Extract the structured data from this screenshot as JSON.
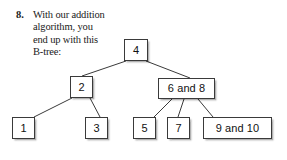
{
  "question": {
    "number": "8.",
    "text": "With our addition\nalgorithm, you\nend up with this\nB-tree:"
  },
  "diagram": {
    "kind": "b-tree",
    "line_color": "#3a3a3a",
    "box_border_color": "#3a3a3a",
    "box_fill_color": "#ffffff",
    "text_color": "#111111",
    "nodes": [
      {
        "id": "root",
        "label": "4",
        "x": 124,
        "y": 39,
        "w": 24,
        "h": 22,
        "level": 0
      },
      {
        "id": "left",
        "label": "2",
        "x": 70,
        "y": 76,
        "w": 23,
        "h": 22,
        "level": 1
      },
      {
        "id": "right",
        "label": "6 and 8",
        "x": 158,
        "y": 78,
        "w": 57,
        "h": 21,
        "level": 1
      },
      {
        "id": "leaf1",
        "label": "1",
        "x": 12,
        "y": 117,
        "w": 23,
        "h": 22,
        "level": 2
      },
      {
        "id": "leaf3",
        "label": "3",
        "x": 85,
        "y": 117,
        "w": 23,
        "h": 22,
        "level": 2
      },
      {
        "id": "leaf5",
        "label": "5",
        "x": 133,
        "y": 117,
        "w": 23,
        "h": 22,
        "level": 2
      },
      {
        "id": "leaf7",
        "label": "7",
        "x": 167,
        "y": 117,
        "w": 23,
        "h": 22,
        "level": 2
      },
      {
        "id": "leaf910",
        "label": "9 and 10",
        "x": 203,
        "y": 117,
        "w": 69,
        "h": 22,
        "level": 2
      }
    ],
    "edges": [
      {
        "id": "root-left",
        "from": "root",
        "to": "left",
        "x1": 126,
        "y1": 61,
        "x2": 82,
        "y2": 76
      },
      {
        "id": "root-right",
        "from": "root",
        "to": "right",
        "x1": 146,
        "y1": 61,
        "x2": 190,
        "y2": 78
      },
      {
        "id": "left-leaf1",
        "from": "left",
        "to": "leaf1",
        "x1": 72,
        "y1": 98,
        "x2": 34,
        "y2": 117
      },
      {
        "id": "left-leaf3",
        "from": "left",
        "to": "leaf3",
        "x1": 90,
        "y1": 98,
        "x2": 100,
        "y2": 117
      },
      {
        "id": "right-leaf5",
        "from": "right",
        "to": "leaf5",
        "x1": 172,
        "y1": 99,
        "x2": 154,
        "y2": 117
      },
      {
        "id": "right-leaf7",
        "from": "right",
        "to": "leaf7",
        "x1": 184,
        "y1": 99,
        "x2": 178,
        "y2": 117
      },
      {
        "id": "right-leaf910",
        "from": "right",
        "to": "leaf910",
        "x1": 198,
        "y1": 99,
        "x2": 213,
        "y2": 117
      }
    ]
  }
}
